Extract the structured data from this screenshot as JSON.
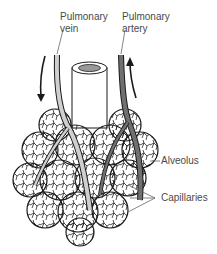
{
  "diagram": {
    "labels": {
      "pulmonary_vein_line1": "Pulmonary",
      "pulmonary_vein_line2": "vein",
      "pulmonary_artery_line1": "Pulmonary",
      "pulmonary_artery_line2": "artery",
      "alveolus": "Alveolus",
      "capillaries": "Capillaries"
    },
    "colors": {
      "vein": "#cfcfcf",
      "artery": "#707070",
      "outline": "#1a1a1a",
      "bronchiole_inner": "#9a9a9a",
      "label_text": "#4a4a4a"
    }
  }
}
